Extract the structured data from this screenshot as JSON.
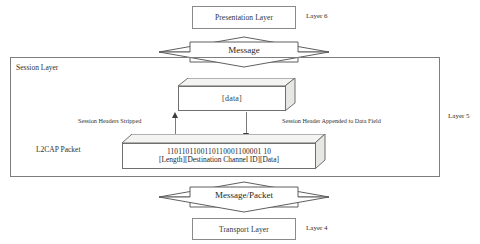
{
  "diagram": {
    "line_color": "#7b7b7b",
    "text_color": "#2f2f2f",
    "accent_color": "#3d3d3d"
  },
  "top": {
    "presentation_box_label": "Presentation Layer",
    "layer6_label": "Layer 6"
  },
  "arrow_top": {
    "label": "Message"
  },
  "session": {
    "container_label": "Session Layer",
    "layer5_label": "Layer 5",
    "data_box_label": "[data]",
    "annotation_left": "Session Headers Stripped",
    "annotation_right": "Session Header Appended to Data Field",
    "packet_name_label": "L2CAP Packet",
    "packet_bits": "110110110011011100011000011 0",
    "packet_bits_display": "1101101100110110001100001 10",
    "packet_fields": "[Length][Destination Channel ID][Data]"
  },
  "arrow_bottom": {
    "label": "Message/Packet"
  },
  "bottom": {
    "transport_box_label": "Transport Layer",
    "layer4_label": "Layer 4"
  }
}
